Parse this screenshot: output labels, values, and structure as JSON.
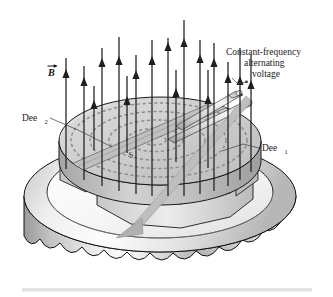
{
  "figure": {
    "background_color": "#ffffff"
  },
  "labels": {
    "magnetic_field": {
      "text": "B",
      "vector_arrow": true,
      "name": "magnetic-field-vector-label",
      "x": 52,
      "y": 72
    },
    "dee_two": {
      "base": "Dee",
      "subscript": "2",
      "name": "dee-2-label",
      "x": 24,
      "y": 122
    },
    "dee_one": {
      "base": "Dee",
      "subscript": "1",
      "name": "dee-1-label",
      "x": 261,
      "y": 152
    },
    "source": {
      "text": "S",
      "name": "source-label",
      "x": 134,
      "y": 156
    },
    "voltage_caption": {
      "line1": "Constant-frequency",
      "line2": "alternating",
      "line3": "voltage",
      "name": "alternating-voltage-caption",
      "x": 273,
      "y": 52
    }
  },
  "colors": {
    "outline": "#111111",
    "field_line": "#1f1f1f",
    "spiral_dash": "#8e8e8e",
    "leader": "#3a3a3a",
    "dee_top_light": "#d6d6d6",
    "dee_top_dark": "#b9b9b9",
    "magnet_light": "#fbfbfb",
    "magnet_mid": "#c9c9c9",
    "magnet_dark": "#8d8d8d",
    "rule": "#e2e2e2"
  },
  "field_lines": {
    "count": 17,
    "direction": "upward",
    "description": "Vertical magnetic field lines pointing up out of the dees",
    "lines": [
      {
        "x": 66,
        "top": 58,
        "bottom": 169,
        "head": 74
      },
      {
        "x": 84,
        "top": 66,
        "bottom": 179,
        "head": 80
      },
      {
        "x": 102,
        "top": 48,
        "bottom": 186,
        "head": 62
      },
      {
        "x": 119,
        "top": 37,
        "bottom": 191,
        "head": 60
      },
      {
        "x": 136,
        "top": 55,
        "bottom": 194,
        "head": 74
      },
      {
        "x": 152,
        "top": 40,
        "bottom": 196,
        "head": 60
      },
      {
        "x": 168,
        "top": 38,
        "bottom": 196,
        "head": 45
      },
      {
        "x": 184,
        "top": 27,
        "bottom": 196,
        "head": 44
      },
      {
        "x": 200,
        "top": 40,
        "bottom": 194,
        "head": 56
      },
      {
        "x": 214,
        "top": 43,
        "bottom": 191,
        "head": 60
      },
      {
        "x": 228,
        "top": 62,
        "bottom": 186,
        "head": 76
      },
      {
        "x": 240,
        "top": 48,
        "bottom": 180,
        "head": 80
      },
      {
        "x": 251,
        "top": 55,
        "bottom": 172,
        "head": 82
      },
      {
        "x": 199,
        "top": 70,
        "bottom": 168,
        "head": 98
      },
      {
        "x": 120,
        "top": 73,
        "bottom": 150,
        "head": 100
      },
      {
        "x": 171,
        "top": 73,
        "bottom": 160,
        "head": 92
      },
      {
        "x": 94,
        "top": 80,
        "bottom": 146,
        "head": 104
      }
    ]
  },
  "spiral": {
    "description": "Dashed spiral path of accelerated particle inside the dees",
    "center_x": 160,
    "center_y": 140,
    "arcs": 4,
    "color": "#8e8e8e"
  },
  "voltage_leads": {
    "count": 2,
    "description": "Two tubular leads carrying alternating voltage to the dees"
  },
  "beam_arrow": {
    "description": "Extracted particle beam arrow exiting toward lower-left",
    "from_x": 246,
    "from_y": 96,
    "to_x": 119,
    "to_y": 235
  },
  "bottom_rule": {
    "present": true,
    "color": "#e2e2e2"
  }
}
